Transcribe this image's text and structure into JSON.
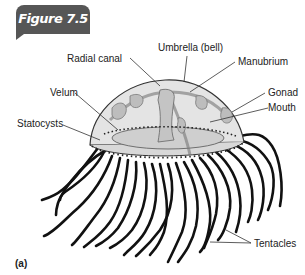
{
  "figure": {
    "tab_label": "Figure 7.5",
    "tab_color": "#565656",
    "panel_label": "(a)"
  },
  "labels": {
    "umbrella": "Umbrella (bell)",
    "radial_canal": "Radial canal",
    "manubrium": "Manubrium",
    "velum": "Velum",
    "gonad": "Gonad",
    "statocysts": "Statocysts",
    "mouth": "Mouth",
    "tentacles": "Tentacles"
  }
}
